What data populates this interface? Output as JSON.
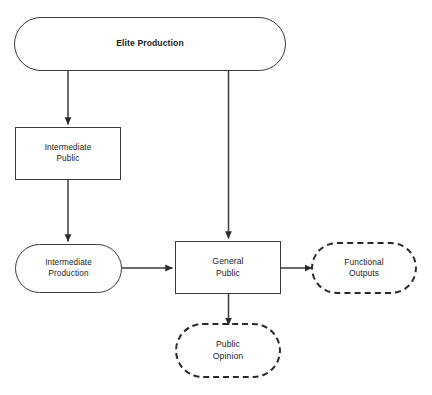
{
  "diagram": {
    "canvas": {
      "width": 432,
      "height": 395,
      "background": "#ffffff"
    },
    "stroke_color": "#3a3a3a",
    "text_color": "#1b1b1b",
    "nodes": [
      {
        "id": "elite-production",
        "label": "Elite Production",
        "shape": "pill",
        "border": "solid",
        "emphasis": "bold"
      },
      {
        "id": "intermediate-public",
        "label": "Intermediate\nPublic",
        "shape": "rectangle",
        "border": "solid",
        "emphasis": "normal"
      },
      {
        "id": "intermediate-production",
        "label": "Intermediate\nProduction",
        "shape": "pill",
        "border": "solid",
        "emphasis": "normal"
      },
      {
        "id": "general-public",
        "label": "General\nPublic",
        "shape": "rectangle",
        "border": "solid",
        "emphasis": "normal"
      },
      {
        "id": "functional-outputs",
        "label": "Functional\nOutputs",
        "shape": "pill",
        "border": "dashed",
        "emphasis": "normal"
      },
      {
        "id": "public-opinion",
        "label": "Public\nOpinion",
        "shape": "pill",
        "border": "dashed",
        "emphasis": "normal"
      }
    ],
    "edges": [
      {
        "id": "edge-elite-to-intermediate-public",
        "from": "elite-production",
        "to": "intermediate-public",
        "direction": "down",
        "arrowhead": true
      },
      {
        "id": "edge-elite-to-general-public",
        "from": "elite-production",
        "to": "general-public",
        "direction": "down",
        "arrowhead": true
      },
      {
        "id": "edge-intermediate-public-to-intermediate-production",
        "from": "intermediate-public",
        "to": "intermediate-production",
        "direction": "down",
        "arrowhead": true
      },
      {
        "id": "edge-intermediate-production-to-general-public",
        "from": "intermediate-production",
        "to": "general-public",
        "direction": "right",
        "arrowhead": true
      },
      {
        "id": "edge-general-public-to-functional-outputs",
        "from": "general-public",
        "to": "functional-outputs",
        "direction": "right",
        "arrowhead": true
      },
      {
        "id": "edge-general-public-to-public-opinion",
        "from": "general-public",
        "to": "public-opinion",
        "direction": "down",
        "arrowhead": true
      }
    ]
  }
}
